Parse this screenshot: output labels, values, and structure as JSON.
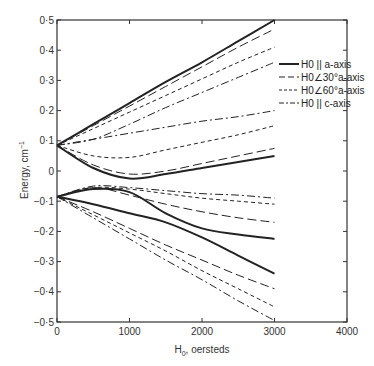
{
  "chart_data": {
    "type": "line",
    "title": "",
    "xlabel": "H0, oersteds",
    "ylabel": "Energy, cm^-1",
    "xlim": [
      0,
      4000
    ],
    "ylim": [
      -0.5,
      0.5
    ],
    "x_ticks": [
      "0",
      "1000",
      "2000",
      "3000",
      "4000"
    ],
    "y_ticks": [
      "0·5",
      "0·4",
      "0·3",
      "0·2",
      "0·1",
      "0",
      "−0·1",
      "−0·2",
      "−0·3",
      "−0·4",
      "−0·5"
    ],
    "grid": false,
    "legend_position": "upper right (inside)",
    "legend": [
      {
        "label": "H0 || a-axis",
        "style": "solid"
      },
      {
        "label": "H0∠30°a-axis",
        "style": "long-dash"
      },
      {
        "label": "H0∠60°a-axis",
        "style": "short-dash"
      },
      {
        "label": "H0 || c-axis",
        "style": "dash-dot"
      }
    ],
    "x": [
      0,
      500,
      1000,
      1500,
      2000,
      2500,
      3000
    ],
    "series": [
      {
        "name": "H0 || a-axis (upper 1)",
        "style": "solid",
        "values": [
          0.085,
          0.155,
          0.225,
          0.295,
          0.36,
          0.43,
          0.5
        ]
      },
      {
        "name": "H0 || a-axis (upper 2)",
        "style": "solid",
        "values": [
          0.085,
          0.01,
          -0.025,
          -0.01,
          0.01,
          0.03,
          0.05
        ]
      },
      {
        "name": "H0 || a-axis (lower 1)",
        "style": "solid",
        "values": [
          -0.085,
          -0.06,
          -0.07,
          -0.14,
          -0.19,
          -0.21,
          -0.225
        ]
      },
      {
        "name": "H0 || a-axis (lower 2)",
        "style": "solid",
        "values": [
          -0.085,
          -0.11,
          -0.14,
          -0.17,
          -0.22,
          -0.28,
          -0.34
        ]
      },
      {
        "name": "H0∠30°a-axis (upper 1)",
        "style": "long-dash",
        "values": [
          0.085,
          0.15,
          0.215,
          0.28,
          0.345,
          0.41,
          0.47
        ]
      },
      {
        "name": "H0∠30°a-axis (upper 2)",
        "style": "long-dash",
        "values": [
          0.085,
          0.02,
          -0.01,
          0.0,
          0.025,
          0.05,
          0.075
        ]
      },
      {
        "name": "H0∠30°a-axis (lower 1)",
        "style": "long-dash",
        "values": [
          -0.085,
          -0.055,
          -0.08,
          -0.11,
          -0.135,
          -0.155,
          -0.17
        ]
      },
      {
        "name": "H0∠30°a-axis (lower 2)",
        "style": "long-dash",
        "values": [
          -0.085,
          -0.135,
          -0.19,
          -0.245,
          -0.295,
          -0.345,
          -0.39
        ]
      },
      {
        "name": "H0∠60°a-axis (upper 1)",
        "style": "short-dash",
        "values": [
          0.085,
          0.14,
          0.195,
          0.25,
          0.305,
          0.36,
          0.41
        ]
      },
      {
        "name": "H0∠60°a-axis (upper 2)",
        "style": "short-dash",
        "values": [
          0.085,
          0.05,
          0.045,
          0.07,
          0.095,
          0.12,
          0.15
        ]
      },
      {
        "name": "H0∠60°a-axis (lower 1)",
        "style": "short-dash",
        "values": [
          -0.085,
          -0.055,
          -0.06,
          -0.075,
          -0.09,
          -0.1,
          -0.11
        ]
      },
      {
        "name": "H0∠60°a-axis (lower 2)",
        "style": "short-dash",
        "values": [
          -0.085,
          -0.145,
          -0.205,
          -0.265,
          -0.33,
          -0.39,
          -0.45
        ]
      },
      {
        "name": "H0 || c-axis (upper 1)",
        "style": "dash-dot",
        "values": [
          0.085,
          0.105,
          0.155,
          0.21,
          0.26,
          0.31,
          0.36
        ]
      },
      {
        "name": "H0 || c-axis (upper 2)",
        "style": "dash-dot",
        "values": [
          0.085,
          0.105,
          0.125,
          0.145,
          0.165,
          0.18,
          0.2
        ]
      },
      {
        "name": "H0 || c-axis (lower 1)",
        "style": "dash-dot",
        "values": [
          -0.085,
          -0.05,
          -0.055,
          -0.065,
          -0.075,
          -0.08,
          -0.09
        ]
      },
      {
        "name": "H0 || c-axis (lower 2)",
        "style": "dash-dot",
        "values": [
          -0.085,
          -0.155,
          -0.225,
          -0.295,
          -0.36,
          -0.43,
          -0.495
        ]
      }
    ]
  }
}
